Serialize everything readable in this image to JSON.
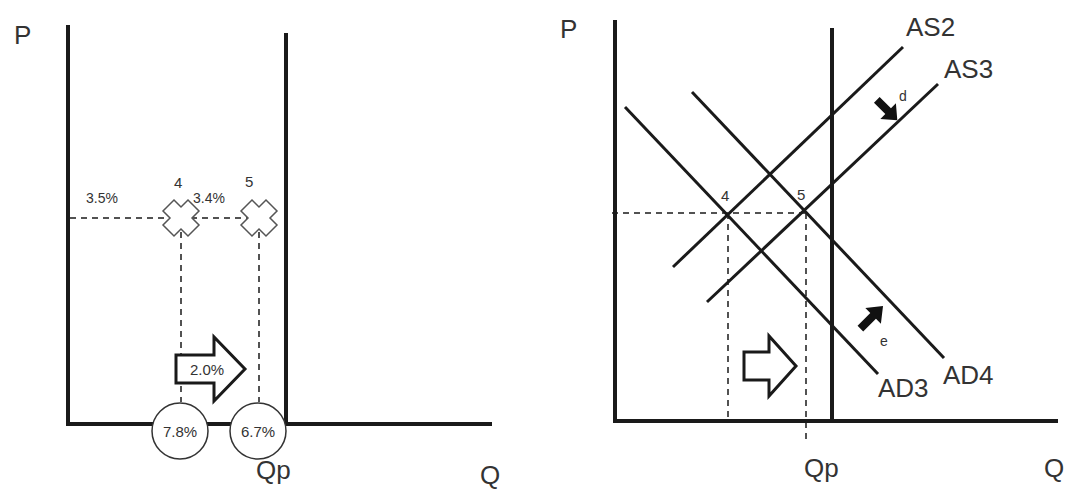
{
  "colors": {
    "background": "#ffffff",
    "line": "#1a1a1a",
    "text": "#333333",
    "marker_outline": "#555555"
  },
  "left_diagram": {
    "y_axis_label": "P",
    "x_axis_label": "Q",
    "potential_output_label": "Qp",
    "points": [
      {
        "id": "4",
        "label": "4",
        "rate_label": "3.5%",
        "circle_label": "7.8%"
      },
      {
        "id": "5",
        "label": "5",
        "rate_label": "3.4%",
        "circle_label": "6.7%"
      }
    ],
    "shift_arrow_label": "2.0%"
  },
  "right_diagram": {
    "y_axis_label": "P",
    "x_axis_label": "Q",
    "potential_output_label": "Qp",
    "curves": [
      {
        "name": "AS2",
        "label": "AS2"
      },
      {
        "name": "AS3",
        "label": "AS3"
      },
      {
        "name": "AD3",
        "label": "AD3"
      },
      {
        "name": "AD4",
        "label": "AD4"
      }
    ],
    "points": [
      {
        "id": "4",
        "label": "4"
      },
      {
        "id": "5",
        "label": "5"
      }
    ],
    "shift_arrows": [
      {
        "id": "d",
        "label": "d",
        "direction": "down-right",
        "affects": "AS2 to AS3"
      },
      {
        "id": "e",
        "label": "e",
        "direction": "up-right",
        "affects": "AD3 to AD4"
      }
    ],
    "hollow_arrow": {
      "direction": "right"
    }
  }
}
